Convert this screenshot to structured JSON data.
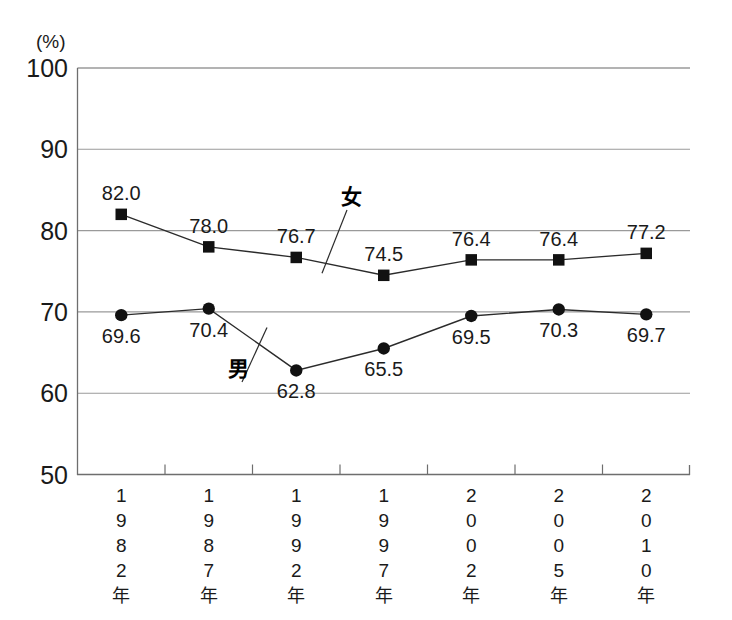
{
  "chart_data": {
    "type": "line",
    "title": "",
    "subtitle": "",
    "xlabel": "",
    "ylabel": "",
    "unit_label": "(%)",
    "ylim": [
      50,
      100
    ],
    "yticks": [
      100,
      90,
      80,
      70,
      60,
      50
    ],
    "ytick_labels": [
      "100",
      "90",
      "80",
      "70",
      "60",
      "50"
    ],
    "grid": true,
    "grid_axis": "y",
    "legend_position": "inline-annotation",
    "categories": [
      "1982年",
      "1987年",
      "1992年",
      "1997年",
      "2002年",
      "2005年",
      "2010年"
    ],
    "series": [
      {
        "name": "女",
        "marker": "square",
        "values": [
          82.0,
          78.0,
          76.7,
          74.5,
          76.4,
          76.4,
          77.2
        ],
        "labels": [
          "82.0",
          "78.0",
          "76.7",
          "74.5",
          "76.4",
          "76.4",
          "77.2"
        ],
        "label_side": [
          "above",
          "above",
          "above",
          "above",
          "above",
          "above",
          "above"
        ]
      },
      {
        "name": "男",
        "marker": "circle",
        "values": [
          69.6,
          70.4,
          62.8,
          65.5,
          69.5,
          70.3,
          69.7
        ],
        "labels": [
          "69.6",
          "70.4",
          "62.8",
          "65.5",
          "69.5",
          "70.3",
          "69.7"
        ],
        "label_side": [
          "below",
          "below",
          "below",
          "below",
          "below",
          "below",
          "below"
        ]
      }
    ],
    "annotations": [
      {
        "text": "女",
        "series": "女",
        "x": 351,
        "y": 204
      },
      {
        "text": "男",
        "series": "男",
        "x": 238,
        "y": 376
      }
    ],
    "colors": {
      "series_line": "#2b2b2b",
      "marker": "#111111",
      "gridline": "#9a9a9a",
      "axis": "#6e6e6e",
      "text": "#1a1a1a",
      "background": "#ffffff"
    }
  }
}
